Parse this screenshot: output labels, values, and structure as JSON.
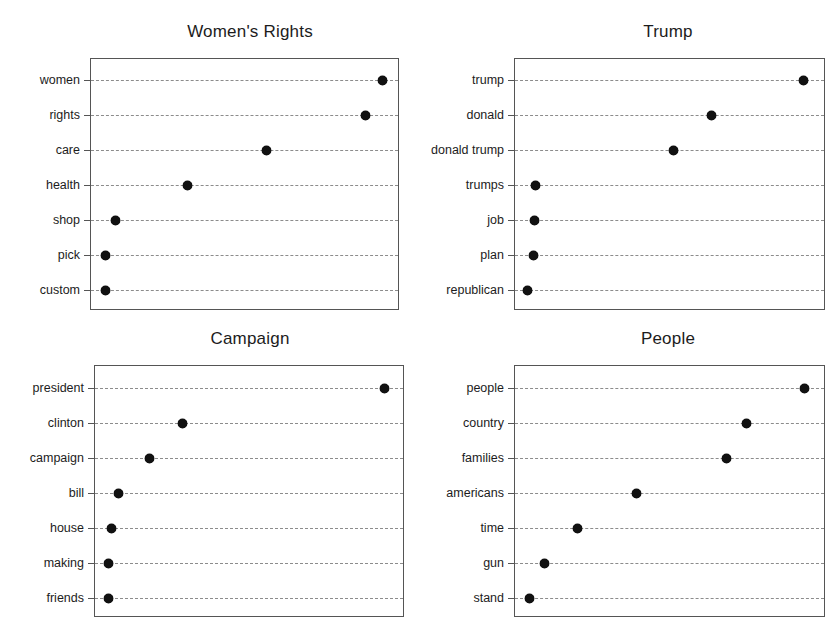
{
  "figure": {
    "width": 839,
    "height": 635,
    "background": "#ffffff",
    "marker_color": "#111111",
    "grid_color": "#8c8c8c",
    "axis_color": "#555555",
    "text_color": "#1c1c1c"
  },
  "chart_data": [
    {
      "type": "scatter",
      "title": "Women's Rights",
      "xlabel": "",
      "ylabel": "",
      "grid": true,
      "grid_style": "dashed-horizontal",
      "legend": "none",
      "marker": "filled-circle",
      "xlim": [
        0,
        1
      ],
      "categories": [
        "women",
        "rights",
        "care",
        "health",
        "shop",
        "pick",
        "custom"
      ],
      "values": [
        0.945,
        0.892,
        0.571,
        0.316,
        0.081,
        0.048,
        0.048
      ],
      "points": [
        {
          "label": "women",
          "value": 0.945
        },
        {
          "label": "rights",
          "value": 0.892
        },
        {
          "label": "care",
          "value": 0.571
        },
        {
          "label": "health",
          "value": 0.316
        },
        {
          "label": "shop",
          "value": 0.081
        },
        {
          "label": "pick",
          "value": 0.048
        },
        {
          "label": "custom",
          "value": 0.048
        }
      ]
    },
    {
      "type": "scatter",
      "title": "Trump",
      "xlabel": "",
      "ylabel": "",
      "grid": true,
      "grid_style": "dashed-horizontal",
      "legend": "none",
      "marker": "filled-circle",
      "xlim": [
        0,
        1
      ],
      "categories": [
        "trump",
        "donald",
        "donald trump",
        "trumps",
        "job",
        "plan",
        "republican"
      ],
      "values": [
        0.929,
        0.633,
        0.511,
        0.068,
        0.064,
        0.061,
        0.042
      ],
      "points": [
        {
          "label": "trump",
          "value": 0.929
        },
        {
          "label": "donald",
          "value": 0.633
        },
        {
          "label": "donald trump",
          "value": 0.511
        },
        {
          "label": "trumps",
          "value": 0.068
        },
        {
          "label": "job",
          "value": 0.064
        },
        {
          "label": "plan",
          "value": 0.061
        },
        {
          "label": "republican",
          "value": 0.042
        }
      ]
    },
    {
      "type": "scatter",
      "title": "Campaign",
      "xlabel": "",
      "ylabel": "",
      "grid": true,
      "grid_style": "dashed-horizontal",
      "legend": "none",
      "marker": "filled-circle",
      "xlim": [
        0,
        1
      ],
      "categories": [
        "president",
        "clinton",
        "campaign",
        "bill",
        "house",
        "making",
        "friends"
      ],
      "values": [
        0.935,
        0.284,
        0.177,
        0.077,
        0.055,
        0.045,
        0.045
      ],
      "points": [
        {
          "label": "president",
          "value": 0.935
        },
        {
          "label": "clinton",
          "value": 0.284
        },
        {
          "label": "campaign",
          "value": 0.177
        },
        {
          "label": "bill",
          "value": 0.077
        },
        {
          "label": "house",
          "value": 0.055
        },
        {
          "label": "making",
          "value": 0.045
        },
        {
          "label": "friends",
          "value": 0.045
        }
      ]
    },
    {
      "type": "scatter",
      "title": "People",
      "xlabel": "",
      "ylabel": "",
      "grid": true,
      "grid_style": "dashed-horizontal",
      "legend": "none",
      "marker": "filled-circle",
      "xlim": [
        0,
        1
      ],
      "categories": [
        "people",
        "country",
        "families",
        "americans",
        "time",
        "gun",
        "stand"
      ],
      "values": [
        0.932,
        0.745,
        0.681,
        0.392,
        0.203,
        0.097,
        0.049
      ],
      "points": [
        {
          "label": "people",
          "value": 0.932
        },
        {
          "label": "country",
          "value": 0.745
        },
        {
          "label": "families",
          "value": 0.681
        },
        {
          "label": "americans",
          "value": 0.392
        },
        {
          "label": "time",
          "value": 0.203
        },
        {
          "label": "gun",
          "value": 0.097
        },
        {
          "label": "stand",
          "value": 0.049
        }
      ]
    }
  ],
  "panels": [
    {
      "name": "womens-rights",
      "title": "Women's Rights",
      "box": {
        "left": 90,
        "top": 58,
        "width": 309,
        "height": 252
      },
      "title_center_x": 250,
      "title_top": 22,
      "rows": [
        {
          "label": "women",
          "x": 382,
          "y": 80
        },
        {
          "label": "rights",
          "x": 365,
          "y": 115
        },
        {
          "label": "care",
          "x": 266,
          "y": 150
        },
        {
          "label": "health",
          "x": 187,
          "y": 185
        },
        {
          "label": "shop",
          "x": 115,
          "y": 220
        },
        {
          "label": "pick",
          "x": 105,
          "y": 255
        },
        {
          "label": "custom",
          "x": 105,
          "y": 290
        }
      ]
    },
    {
      "name": "trump",
      "title": "Trump",
      "box": {
        "left": 514,
        "top": 58,
        "width": 311,
        "height": 252
      },
      "title_center_x": 668,
      "title_top": 22,
      "rows": [
        {
          "label": "trump",
          "x": 803,
          "y": 80
        },
        {
          "label": "donald",
          "x": 711,
          "y": 115
        },
        {
          "label": "donald trump",
          "x": 673,
          "y": 150
        },
        {
          "label": "trumps",
          "x": 535,
          "y": 185
        },
        {
          "label": "job",
          "x": 534,
          "y": 220
        },
        {
          "label": "plan",
          "x": 533,
          "y": 255
        },
        {
          "label": "republican",
          "x": 527,
          "y": 290
        }
      ]
    },
    {
      "name": "campaign",
      "title": "Campaign",
      "box": {
        "left": 94,
        "top": 365,
        "width": 310,
        "height": 252
      },
      "title_center_x": 250,
      "title_top": 329,
      "rows": [
        {
          "label": "president",
          "x": 384,
          "y": 388
        },
        {
          "label": "clinton",
          "x": 182,
          "y": 423
        },
        {
          "label": "campaign",
          "x": 149,
          "y": 458
        },
        {
          "label": "bill",
          "x": 118,
          "y": 493
        },
        {
          "label": "house",
          "x": 111,
          "y": 528
        },
        {
          "label": "making",
          "x": 108,
          "y": 563
        },
        {
          "label": "friends",
          "x": 108,
          "y": 598
        }
      ]
    },
    {
      "name": "people",
      "title": "People",
      "box": {
        "left": 514,
        "top": 365,
        "width": 311,
        "height": 252
      },
      "title_center_x": 668,
      "title_top": 329,
      "rows": [
        {
          "label": "people",
          "x": 804,
          "y": 388
        },
        {
          "label": "country",
          "x": 746,
          "y": 423
        },
        {
          "label": "families",
          "x": 726,
          "y": 458
        },
        {
          "label": "americans",
          "x": 636,
          "y": 493
        },
        {
          "label": "time",
          "x": 577,
          "y": 528
        },
        {
          "label": "gun",
          "x": 544,
          "y": 563
        },
        {
          "label": "stand",
          "x": 529,
          "y": 598
        }
      ]
    }
  ]
}
